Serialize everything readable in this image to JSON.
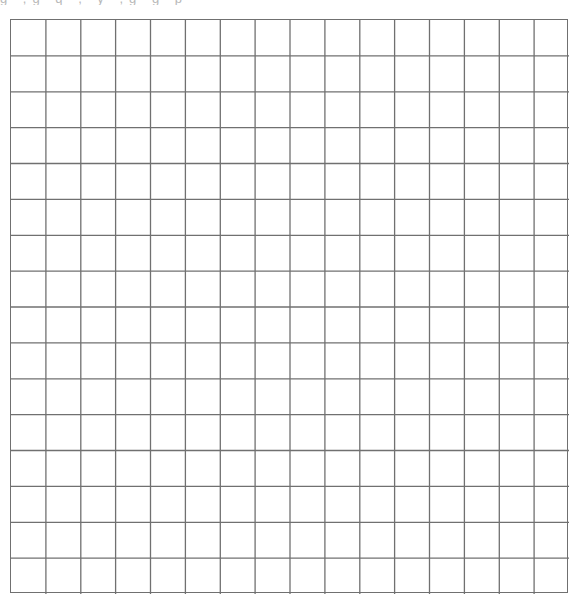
{
  "page": {
    "top_text_fragments": "g  ,g  q    ,  y  ,g  g    p"
  },
  "grid": {
    "columns": 16,
    "rows": 16,
    "left": 10,
    "top": 19,
    "width": 558,
    "height": 574,
    "line_color": "#707070",
    "background": "#ffffff"
  }
}
